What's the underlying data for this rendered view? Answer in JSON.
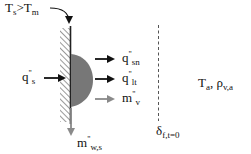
{
  "diagram": {
    "labels": {
      "wall_condition": {
        "main": "T",
        "sub1": "s",
        "op": ">",
        "main2": "T",
        "sub2": "m"
      },
      "heat_flux_in": {
        "main": "q",
        "primes": "\"",
        "sub": "s"
      },
      "heat_flux_sn": {
        "main": "q",
        "primes": "\"",
        "sub": "sn"
      },
      "heat_flux_lt": {
        "main": "q",
        "primes": "\"",
        "sub": "lt"
      },
      "vapor_flux": {
        "main": "m",
        "primes": "\"",
        "sub": "v"
      },
      "wall_mass_flux": {
        "main": "m",
        "primes": "\"",
        "sub": "w,s"
      },
      "ambient": {
        "t": "T",
        "t_sub": "a",
        "sep": ",",
        "rho": "ρ",
        "rho_sub": "v,a"
      },
      "boundary": {
        "delta": "δ",
        "sub": "f,t=0"
      }
    },
    "colors": {
      "wall_line": "#222222",
      "droplet": "#777777",
      "arrow_dark": "#111111",
      "arrow_gray": "#8a8a8a",
      "dashed_line": "#555555"
    }
  }
}
